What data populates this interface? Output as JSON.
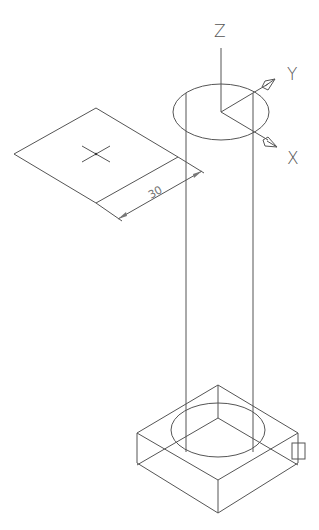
{
  "viewport": {
    "background": "#ffffff",
    "line_color": "#555555",
    "view": "isometric"
  },
  "ucs_icon": {
    "z_label": "Z",
    "y_label": "Y",
    "x_label": "X"
  },
  "work_plane": {
    "crosshair": "plus-marker"
  },
  "dimension": {
    "value": "30"
  },
  "cylinder": {
    "type": "cylinder"
  },
  "base_box": {
    "type": "box-with-circular-recess",
    "grip": "square-grip"
  }
}
